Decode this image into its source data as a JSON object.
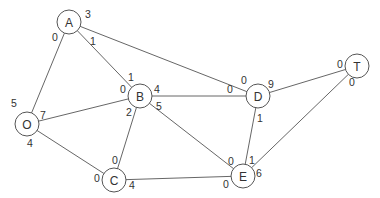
{
  "diagram": {
    "type": "network-flow-graph",
    "nodes": [
      {
        "id": "A",
        "label": "A",
        "x": 69,
        "y": 22
      },
      {
        "id": "O",
        "label": "O",
        "x": 27,
        "y": 124
      },
      {
        "id": "B",
        "label": "B",
        "x": 140,
        "y": 96
      },
      {
        "id": "D",
        "label": "D",
        "x": 258,
        "y": 96
      },
      {
        "id": "T",
        "label": "T",
        "x": 357,
        "y": 66
      },
      {
        "id": "C",
        "label": "C",
        "x": 114,
        "y": 180
      },
      {
        "id": "E",
        "label": "E",
        "x": 243,
        "y": 176
      }
    ],
    "edges": [
      {
        "from": "O",
        "to": "A",
        "from_label": "5",
        "to_label": "0",
        "from_pos": [
          14,
          103
        ],
        "to_pos": [
          55,
          37
        ]
      },
      {
        "from": "O",
        "to": "B",
        "from_label": "7",
        "to_label": "0",
        "from_pos": [
          43,
          115
        ],
        "to_pos": [
          123,
          89
        ]
      },
      {
        "from": "O",
        "to": "C",
        "from_label": "4",
        "to_label": "0",
        "from_pos": [
          30,
          143
        ],
        "to_pos": [
          97,
          178
        ]
      },
      {
        "from": "A",
        "to": "B",
        "from_label": "1",
        "to_label": "1",
        "from_pos": [
          93,
          41
        ],
        "to_pos": [
          131,
          77
        ]
      },
      {
        "from": "A",
        "to": "D",
        "from_label": "3",
        "to_label": "0",
        "from_pos": [
          88,
          14
        ],
        "to_pos": [
          244,
          80
        ]
      },
      {
        "from": "B",
        "to": "D",
        "from_label": "4",
        "to_label": "0",
        "from_pos": [
          157,
          89
        ],
        "to_pos": [
          230,
          89
        ]
      },
      {
        "from": "B",
        "to": "C",
        "from_label": "2",
        "to_label": "0",
        "from_pos": [
          129,
          112
        ],
        "to_pos": [
          115,
          160
        ]
      },
      {
        "from": "B",
        "to": "E",
        "from_label": "5",
        "to_label": "0",
        "from_pos": [
          159,
          106
        ],
        "to_pos": [
          231,
          161
        ]
      },
      {
        "from": "C",
        "to": "E",
        "from_label": "4",
        "to_label": "0",
        "from_pos": [
          132,
          185
        ],
        "to_pos": [
          226,
          184
        ]
      },
      {
        "from": "D",
        "to": "E",
        "from_label": "1",
        "to_label": "1",
        "from_pos": [
          260,
          118
        ],
        "to_pos": [
          252,
          160
        ]
      },
      {
        "from": "D",
        "to": "T",
        "from_label": "9",
        "to_label": "0",
        "from_pos": [
          271,
          84
        ],
        "to_pos": [
          340,
          64
        ]
      },
      {
        "from": "E",
        "to": "T",
        "from_label": "6",
        "to_label": "0",
        "from_pos": [
          259,
          173
        ],
        "to_pos": [
          352,
          82
        ]
      }
    ]
  }
}
